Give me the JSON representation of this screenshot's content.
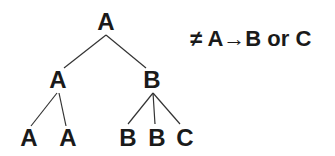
{
  "tree": {
    "root": {
      "label": "A",
      "x": 106,
      "y": 10
    },
    "mid_left": {
      "label": "A",
      "x": 58,
      "y": 68
    },
    "mid_right": {
      "label": "B",
      "x": 152,
      "y": 68
    },
    "leaves": [
      {
        "label": "A",
        "x": 29,
        "y": 126
      },
      {
        "label": "A",
        "x": 68,
        "y": 126
      },
      {
        "label": "B",
        "x": 128,
        "y": 126
      },
      {
        "label": "B",
        "x": 157,
        "y": 126
      },
      {
        "label": "C",
        "x": 185,
        "y": 126
      }
    ]
  },
  "rule": {
    "not_symbol": "≠",
    "lhs": "A",
    "arrow": "→",
    "rhs": "B or C"
  }
}
